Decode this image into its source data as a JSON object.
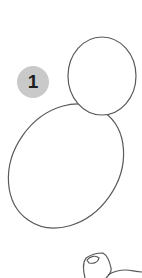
{
  "step": {
    "number": "1",
    "badge_color": "#c9c9c9",
    "text_color": "#1e1e1e"
  },
  "drawing": {
    "stroke_color": "#5a5a5a",
    "shapes": [
      {
        "name": "head-circle",
        "type": "ellipse"
      },
      {
        "name": "body-ellipse",
        "type": "ellipse"
      },
      {
        "name": "pencil-hand",
        "type": "sketch"
      }
    ]
  }
}
